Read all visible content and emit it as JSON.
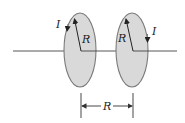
{
  "diagram": {
    "left_loop": {
      "current_label": "I",
      "radius_label": "R"
    },
    "right_loop": {
      "current_label": "I",
      "radius_label": "R"
    },
    "separation_label": "R",
    "colors": {
      "loop_fill": "#d9d9d9",
      "loop_stroke": "#7a7a7a",
      "line": "#333333"
    }
  }
}
